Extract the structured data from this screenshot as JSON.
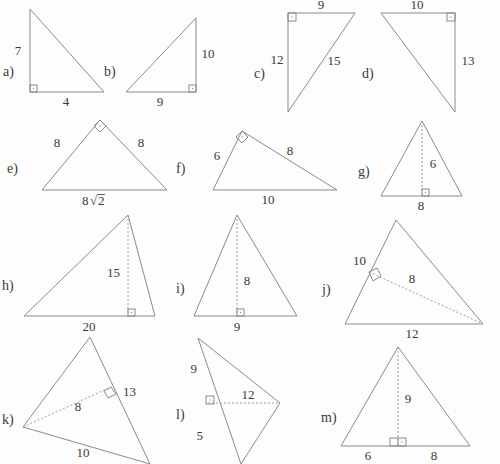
{
  "worksheet": {
    "background_color": "#fdfdfd",
    "line_color": "#8a8a8a",
    "text_color": "#3a3a3a",
    "figure_count": 13
  },
  "figures": [
    {
      "key": "a",
      "label": "a)",
      "kind": "right-triangle",
      "right_angle_at": "bottom-left",
      "labels": {
        "vertical": "7",
        "base": "4"
      }
    },
    {
      "key": "b",
      "label": "b)",
      "kind": "right-triangle",
      "right_angle_at": "bottom-right",
      "labels": {
        "vertical": "10",
        "base": "9"
      }
    },
    {
      "key": "c",
      "label": "c)",
      "kind": "right-triangle",
      "right_angle_at": "top-left",
      "labels": {
        "top": "9",
        "vertical": "12",
        "hypotenuse": "15"
      }
    },
    {
      "key": "d",
      "label": "d)",
      "kind": "right-triangle",
      "right_angle_at": "top-right",
      "labels": {
        "top": "10",
        "vertical": "13"
      }
    },
    {
      "key": "e",
      "label": "e)",
      "kind": "isosceles-right-triangle",
      "right_angle_at": "apex",
      "labels": {
        "left": "8",
        "right": "8",
        "base_coefficient": "8",
        "base_radicand": "2"
      }
    },
    {
      "key": "f",
      "label": "f)",
      "kind": "right-triangle",
      "right_angle_at": "apex",
      "labels": {
        "left": "6",
        "right": "8",
        "base": "10"
      }
    },
    {
      "key": "g",
      "label": "g)",
      "kind": "triangle-with-altitude",
      "right_angle_at": "foot-of-altitude",
      "labels": {
        "height": "6",
        "base": "8"
      }
    },
    {
      "key": "h",
      "label": "h)",
      "kind": "triangle-with-altitude",
      "right_angle_at": "foot-of-altitude",
      "labels": {
        "height": "15",
        "base": "20"
      }
    },
    {
      "key": "i",
      "label": "i)",
      "kind": "triangle-with-altitude",
      "right_angle_at": "foot-of-altitude",
      "labels": {
        "height": "8",
        "base": "9"
      }
    },
    {
      "key": "j",
      "label": "j)",
      "kind": "triangle-with-altitude-to-side",
      "right_angle_at": "foot-on-left-side",
      "labels": {
        "left_side": "10",
        "altitude": "8",
        "base": "12"
      }
    },
    {
      "key": "k",
      "label": "k)",
      "kind": "triangle-with-altitude-to-side",
      "right_angle_at": "foot-on-right-side",
      "labels": {
        "altitude": "8",
        "right_side": "13",
        "base": "10"
      }
    },
    {
      "key": "l",
      "label": "l)",
      "kind": "triangle-with-altitude-to-extended-side",
      "right_angle_at": "foot-on-left-side",
      "labels": {
        "upper_segment": "9",
        "altitude": "12",
        "lower_segment": "5"
      }
    },
    {
      "key": "m",
      "label": "m)",
      "kind": "triangle-with-altitude-split-base",
      "right_angle_at": "foot-of-altitude",
      "labels": {
        "height": "9",
        "base_left": "6",
        "base_right": "8"
      }
    }
  ]
}
